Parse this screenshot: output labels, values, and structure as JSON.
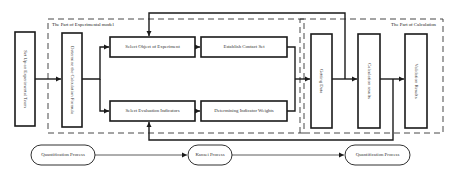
{
  "regions": {
    "experimental_model": "The Part of Experimental model",
    "calculation": "The Part of Calculation"
  },
  "boxes": {
    "setup_team": "Set Up an Experimental Team",
    "determine_formula": "Determine the Calculation Formula",
    "select_object": "Select Object of Experiment",
    "establish_contact": "Establish Contact Set",
    "select_indicators": "Select Evaluation Indicators",
    "indicator_weights": "Determining Indicator Weights",
    "getting_data": "Getting Data",
    "calc_results": "Calculation results",
    "validation_results": "Validation Results"
  },
  "processes": [
    {
      "label": "Quantification Process"
    },
    {
      "label": "Kansei Process"
    },
    {
      "label": "Quantification Process"
    }
  ],
  "colors": {
    "stroke": "#1a1a1a",
    "background": "#ffffff"
  }
}
